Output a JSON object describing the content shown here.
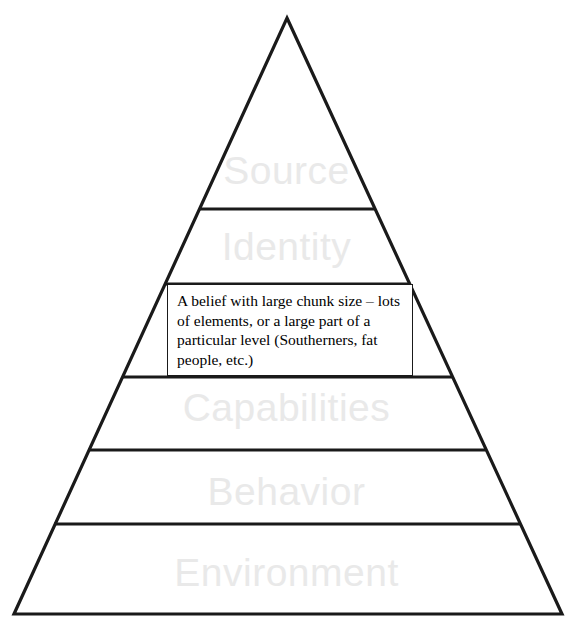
{
  "diagram": {
    "type": "pyramid",
    "layer_text_color": "#e9e9e9",
    "outline_color": "#1a1a1a",
    "background_color": "#ffffff",
    "levels": [
      {
        "id": "source",
        "label": "Source",
        "order": 1
      },
      {
        "id": "identity",
        "label": "Identity",
        "order": 2
      },
      {
        "id": "beliefs",
        "label": "Beliefs",
        "order": 3
      },
      {
        "id": "capabilities",
        "label": "Capabilities",
        "order": 4
      },
      {
        "id": "behavior",
        "label": "Behavior",
        "order": 5
      },
      {
        "id": "environment",
        "label": "Environment",
        "order": 6
      }
    ]
  },
  "callout": {
    "text": "A belief with large chunk size – lots of elements, or a large part of a particular level (Southerners, fat people, etc.)",
    "border_color": "#1a1a1a",
    "background_color": "#ffffff"
  }
}
